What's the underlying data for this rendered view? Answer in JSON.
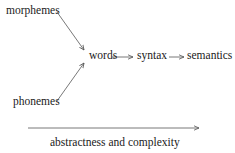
{
  "diagram": {
    "nodes": {
      "morphemes": "morphemes",
      "phonemes": "phonemes",
      "words": "words",
      "syntax": "syntax",
      "semantics": "semantics"
    },
    "edges": [
      {
        "from": "morphemes",
        "to": "words"
      },
      {
        "from": "phonemes",
        "to": "words"
      },
      {
        "from": "words",
        "to": "syntax"
      },
      {
        "from": "syntax",
        "to": "semantics"
      }
    ],
    "axis": {
      "label": "abstractness and complexity",
      "direction": "left-to-right"
    },
    "colors": {
      "text": "#1a1a1a",
      "line": "#555555",
      "background": "#ffffff"
    }
  }
}
